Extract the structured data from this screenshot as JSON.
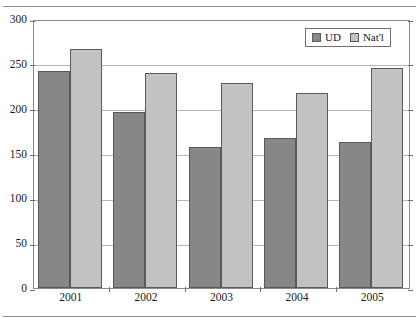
{
  "chart_data": {
    "type": "bar",
    "title": "",
    "xlabel": "",
    "ylabel": "",
    "categories": [
      "2001",
      "2002",
      "2003",
      "2004",
      "2005"
    ],
    "series": [
      {
        "name": "UD",
        "color": "#878787",
        "values": [
          242,
          196,
          157,
          167,
          163
        ]
      },
      {
        "name": "Nat'l",
        "color": "#c2c2c2",
        "values": [
          267,
          240,
          229,
          217,
          245
        ]
      }
    ],
    "ylim": [
      0,
      300
    ],
    "ytick_labels": [
      "0",
      "50",
      "100",
      "150",
      "200",
      "250",
      "300"
    ],
    "ytick_values": [
      0,
      50,
      100,
      150,
      200,
      250,
      300
    ],
    "grid": true,
    "legend_position": "top-right"
  },
  "legend": {
    "entries": [
      {
        "label": "UD",
        "swatch": "ud"
      },
      {
        "label": "Nat'l",
        "swatch": "natl"
      }
    ]
  }
}
